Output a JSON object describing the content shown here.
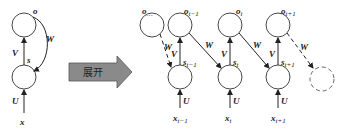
{
  "diagram": {
    "type": "rnn-unfold",
    "colors": {
      "stroke": "#333333",
      "arrow_fill": "#8a8a8a",
      "arrow_stroke": "#555555",
      "background": "#ffffff"
    },
    "folded": {
      "output_node": "o",
      "hidden_node": "s",
      "input": "x",
      "edges": {
        "input_to_hidden": "U",
        "hidden_to_output": "V",
        "recurrent": "W"
      }
    },
    "unfold_arrow": {
      "label": "展开"
    },
    "unfolded": {
      "outputs": [
        {
          "base": "o",
          "sub": "…"
        },
        {
          "base": "o",
          "sub": "t−1"
        },
        {
          "base": "o",
          "sub": "t"
        },
        {
          "base": "o",
          "sub": "t+1"
        }
      ],
      "hidden": [
        {
          "base": "s",
          "sub": "t−1"
        },
        {
          "base": "s",
          "sub": "t"
        },
        {
          "base": "s",
          "sub": "t+1"
        }
      ],
      "inputs": [
        {
          "base": "x",
          "sub": "t−1"
        },
        {
          "base": "x",
          "sub": "t"
        },
        {
          "base": "x",
          "sub": "t+1"
        }
      ],
      "edge_labels": {
        "U": "U",
        "V": "V",
        "W": "W"
      }
    }
  }
}
